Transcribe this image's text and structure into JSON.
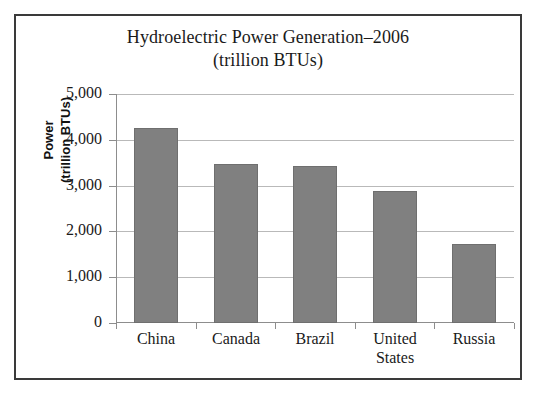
{
  "chart_data": {
    "type": "bar",
    "title": "Hydroelectric Power Generation–2006",
    "subtitle": "(trillion BTUs)",
    "title_lines": [
      "Hydroelectric Power Generation–2006",
      "(trillion BTUs)"
    ],
    "xlabel": "",
    "ylabel": "Power (trillion BTUs)",
    "ylabel_lines": [
      "Power",
      "(trillion BTUs)"
    ],
    "categories": [
      "China",
      "Canada",
      "Brazil",
      "United States",
      "Russia"
    ],
    "category_lines": [
      [
        "China"
      ],
      [
        "Canada"
      ],
      [
        "Brazil"
      ],
      [
        "United",
        "States"
      ],
      [
        "Russia"
      ]
    ],
    "values": [
      4260,
      3470,
      3420,
      2880,
      1730
    ],
    "ylim": [
      0,
      5000
    ],
    "ytick_values": [
      0,
      1000,
      2000,
      3000,
      4000,
      5000
    ],
    "ytick_labels": [
      "0",
      "1,000",
      "2,000",
      "3,000",
      "4,000",
      "5,000"
    ],
    "grid": true,
    "legend": false,
    "bar_color": "#808080",
    "frame_color": "#3a3a3a",
    "gridline_color": "#b9b9b9",
    "axis_color": "#8d8d8d"
  }
}
